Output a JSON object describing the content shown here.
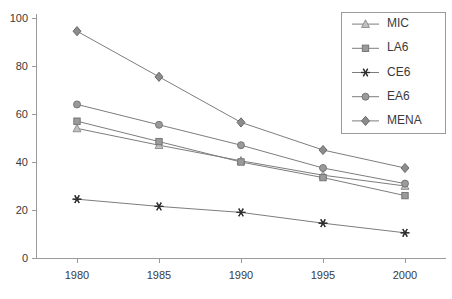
{
  "chart_data": {
    "type": "line",
    "title": "",
    "xlabel": "",
    "ylabel": "",
    "categories": [
      "1980",
      "1985",
      "1990",
      "1995",
      "2000"
    ],
    "x": [
      1980,
      1985,
      1990,
      1995,
      2000
    ],
    "xlim": [
      1977.5,
      2002.5
    ],
    "ylim": [
      0,
      100
    ],
    "ytick_labels": [
      "0",
      "20",
      "40",
      "60",
      "80",
      "100"
    ],
    "ytick_values": [
      0,
      20,
      40,
      60,
      80,
      100
    ],
    "grid": false,
    "legend_position": "top-right",
    "series": [
      {
        "name": "MIC",
        "marker": "triangle",
        "marker_color": "#c0c0c0",
        "line_color": "#7d7d7d",
        "values": [
          54,
          47,
          40.5,
          34.5,
          30
        ]
      },
      {
        "name": "LA6",
        "marker": "square",
        "marker_color": "#9a9a9a",
        "line_color": "#7d7d7d",
        "values": [
          57,
          48.5,
          40,
          33.5,
          26
        ]
      },
      {
        "name": "CE6",
        "marker": "star",
        "marker_color": "#2f2f2f",
        "line_color": "#7d7d7d",
        "values": [
          24.5,
          21.5,
          19,
          14.5,
          10.5
        ]
      },
      {
        "name": "EA6",
        "marker": "circle",
        "marker_color": "#9a9a9a",
        "line_color": "#7d7d7d",
        "values": [
          64,
          55.5,
          47,
          37.5,
          31
        ]
      },
      {
        "name": "MENA",
        "marker": "diamond",
        "marker_color": "#8c8c8c",
        "line_color": "#7d7d7d",
        "values": [
          94.5,
          75.5,
          56.5,
          45,
          37.5
        ]
      }
    ]
  }
}
